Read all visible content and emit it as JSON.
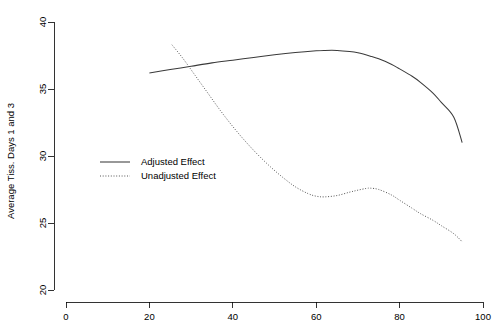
{
  "chart_data": {
    "type": "line",
    "title": "",
    "subtitle": "",
    "xlabel": "",
    "ylabel": "Average Tiss. Days 1 and 3",
    "xlim": [
      0,
      100
    ],
    "ylim": [
      20,
      40
    ],
    "xticks": [
      0,
      20,
      40,
      60,
      80,
      100
    ],
    "yticks": [
      20,
      25,
      30,
      35,
      40
    ],
    "xtick_labels": [
      "0",
      "20",
      "40",
      "60",
      "80",
      "100"
    ],
    "ytick_labels": [
      "20",
      "25",
      "30",
      "35",
      "40"
    ],
    "grid": false,
    "legend_position": "center-left",
    "series": [
      {
        "name": "Adjusted Effect",
        "style": "solid",
        "color": "#3a3a3a",
        "x": [
          20,
          25,
          30,
          35,
          40,
          45,
          50,
          55,
          60,
          62,
          65,
          68,
          70,
          73,
          75,
          78,
          80,
          83,
          85,
          88,
          90,
          93,
          95
        ],
        "y": [
          36.2,
          36.45,
          36.7,
          36.95,
          37.15,
          37.35,
          37.55,
          37.72,
          37.85,
          37.88,
          37.88,
          37.8,
          37.7,
          37.45,
          37.25,
          36.85,
          36.5,
          35.95,
          35.5,
          34.7,
          34.0,
          32.9,
          31.0
        ]
      },
      {
        "name": "Unadjusted Effect",
        "style": "dotted",
        "color": "#555555",
        "x": [
          25.4,
          28,
          31,
          34,
          37,
          40,
          43,
          46,
          49,
          52,
          55,
          58,
          60,
          62,
          65,
          68,
          70,
          72,
          73,
          75,
          78,
          80,
          83,
          85,
          88,
          90,
          93,
          95
        ],
        "y": [
          38.3,
          37.3,
          36.0,
          34.7,
          33.4,
          32.2,
          31.1,
          30.1,
          29.2,
          28.4,
          27.7,
          27.2,
          27.0,
          26.95,
          27.05,
          27.3,
          27.45,
          27.58,
          27.6,
          27.5,
          27.1,
          26.7,
          26.1,
          25.7,
          25.2,
          24.8,
          24.2,
          23.6
        ]
      }
    ]
  },
  "legend": {
    "items": [
      {
        "label": "Adjusted Effect",
        "style": "solid"
      },
      {
        "label": "Unadjusted Effect",
        "style": "dotted"
      }
    ]
  },
  "axes": {
    "y_title": "Average Tiss. Days 1 and 3"
  }
}
